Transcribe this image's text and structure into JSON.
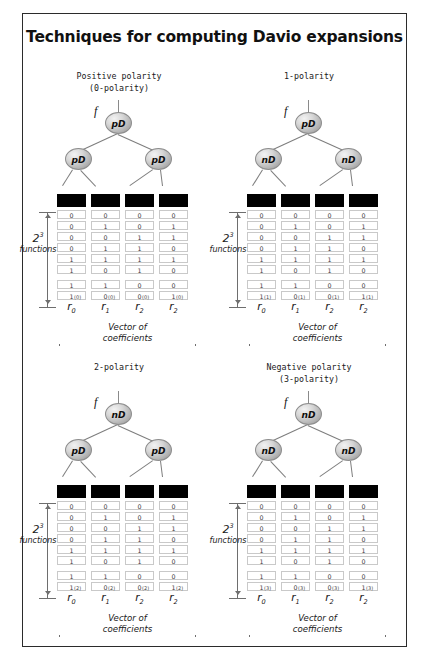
{
  "title": "Techniques for computing Davio expansions",
  "labels": {
    "functions_count": "2",
    "functions_exp": "3",
    "functions_word": "functions",
    "vector_line1": "Vector of",
    "vector_line2": "coefficients",
    "root_symbol": "f"
  },
  "panels": [
    {
      "id": "positive-polarity",
      "heading_line1": "Positive polarity",
      "heading_line2": "(0-polarity)",
      "tree": {
        "root": "pD",
        "left": "pD",
        "right": "pD"
      },
      "superscript": "(0)",
      "column_labels": [
        "r",
        "r",
        "r",
        "r"
      ],
      "column_subscripts": [
        "0",
        "1",
        "2",
        "2"
      ],
      "table": [
        [
          "0",
          "0",
          "0",
          "0"
        ],
        [
          "0",
          "1",
          "0",
          "1"
        ],
        [
          "0",
          "0",
          "1",
          "1"
        ],
        [
          "0",
          "1",
          "1",
          "0"
        ],
        [
          "1",
          "1",
          "1",
          "1"
        ],
        [
          "1",
          "0",
          "1",
          "0"
        ],
        [
          "1",
          "1",
          "0",
          "0"
        ],
        [
          "1",
          "0",
          "0",
          "1"
        ]
      ]
    },
    {
      "id": "1-polarity",
      "heading_line1": "1-polarity",
      "heading_line2": "",
      "tree": {
        "root": "pD",
        "left": "nD",
        "right": "nD"
      },
      "superscript": "(1)",
      "column_labels": [
        "r",
        "r",
        "r",
        "r"
      ],
      "column_subscripts": [
        "0",
        "1",
        "2",
        "2"
      ],
      "table": [
        [
          "0",
          "0",
          "0",
          "0"
        ],
        [
          "0",
          "1",
          "0",
          "1"
        ],
        [
          "0",
          "0",
          "1",
          "1"
        ],
        [
          "0",
          "1",
          "1",
          "0"
        ],
        [
          "1",
          "1",
          "1",
          "1"
        ],
        [
          "1",
          "0",
          "1",
          "0"
        ],
        [
          "1",
          "1",
          "0",
          "0"
        ],
        [
          "1",
          "0",
          "0",
          "1"
        ]
      ]
    },
    {
      "id": "2-polarity",
      "heading_line1": "2-polarity",
      "heading_line2": "",
      "tree": {
        "root": "nD",
        "left": "pD",
        "right": "pD"
      },
      "superscript": "(2)",
      "column_labels": [
        "r",
        "r",
        "r",
        "r"
      ],
      "column_subscripts": [
        "0",
        "1",
        "2",
        "2"
      ],
      "table": [
        [
          "0",
          "0",
          "0",
          "0"
        ],
        [
          "0",
          "1",
          "0",
          "1"
        ],
        [
          "0",
          "0",
          "1",
          "1"
        ],
        [
          "0",
          "1",
          "1",
          "0"
        ],
        [
          "1",
          "1",
          "1",
          "1"
        ],
        [
          "1",
          "0",
          "1",
          "0"
        ],
        [
          "1",
          "1",
          "0",
          "0"
        ],
        [
          "1",
          "0",
          "0",
          "1"
        ]
      ]
    },
    {
      "id": "negative-polarity",
      "heading_line1": "Negative polarity",
      "heading_line2": "(3-polarity)",
      "tree": {
        "root": "nD",
        "left": "nD",
        "right": "nD"
      },
      "superscript": "(3)",
      "column_labels": [
        "r",
        "r",
        "r",
        "r"
      ],
      "column_subscripts": [
        "0",
        "1",
        "2",
        "2"
      ],
      "table": [
        [
          "0",
          "0",
          "0",
          "0"
        ],
        [
          "0",
          "1",
          "0",
          "1"
        ],
        [
          "0",
          "0",
          "1",
          "1"
        ],
        [
          "0",
          "1",
          "1",
          "0"
        ],
        [
          "1",
          "1",
          "1",
          "1"
        ],
        [
          "1",
          "0",
          "1",
          "0"
        ],
        [
          "1",
          "1",
          "0",
          "0"
        ],
        [
          "1",
          "0",
          "0",
          "1"
        ]
      ]
    }
  ]
}
